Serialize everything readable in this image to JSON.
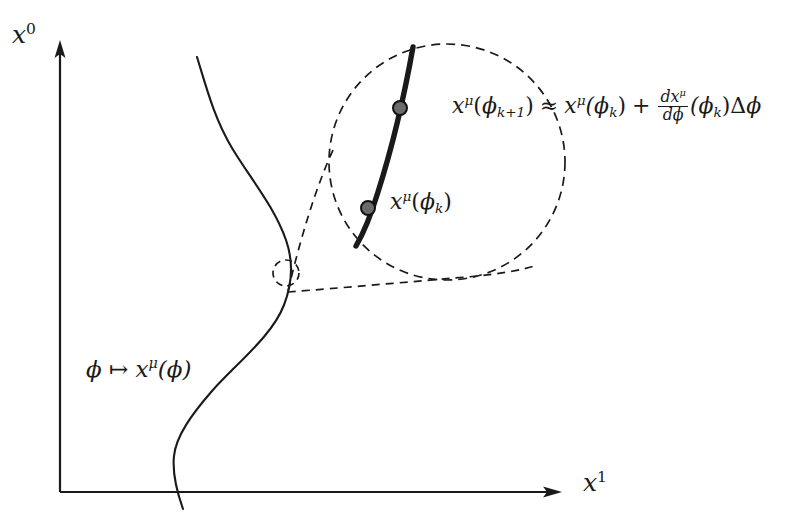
{
  "figure": {
    "type": "mathematical-diagram",
    "background_color": "#ffffff",
    "ink_color": "#1a1a1a",
    "dot_fill_color": "#666666"
  },
  "axes": {
    "y_label": "x",
    "y_label_exponent": "0",
    "x_label": "x",
    "x_label_exponent": "1",
    "origin_px": [
      60,
      492
    ],
    "y_axis_top_px": [
      60,
      48
    ],
    "x_axis_right_px": [
      560,
      492
    ]
  },
  "curve": {
    "label_arg": "ϕ",
    "label_maps_to": "↦",
    "label_fn": "x",
    "label_fn_exponent": "μ",
    "label_fn_arg": "(ϕ)",
    "label_full": "ϕ ↦ x^μ(ϕ)"
  },
  "magnifier": {
    "small_circle_center_px": [
      286,
      273
    ],
    "small_circle_radius_px": 13,
    "big_circle_center_px": [
      447,
      162
    ],
    "big_circle_radius_px": 118,
    "cone_apex_px": [
      288,
      291
    ],
    "line_style": "dashed"
  },
  "inset": {
    "segment_start_px": [
      413,
      47
    ],
    "segment_end_px": [
      356,
      246
    ],
    "points": [
      {
        "name": "phi-k-plus-1",
        "px": [
          400,
          108
        ]
      },
      {
        "name": "phi-k",
        "px": [
          368,
          208
        ]
      }
    ],
    "label_point_k": {
      "fn": "x",
      "exponent": "μ",
      "arg_open": "(",
      "arg_sym": "ϕ",
      "arg_sub": "k",
      "arg_close": ")"
    },
    "label_taylor": {
      "lhs_fn": "x",
      "lhs_exponent": "μ",
      "lhs_arg_open": "(",
      "lhs_arg_sym": "ϕ",
      "lhs_arg_sub": "k+1",
      "lhs_arg_close": ")",
      "relation": "≈",
      "rhs1_fn": "x",
      "rhs1_exponent": "μ",
      "rhs1_arg": "(ϕ",
      "rhs1_sub": "k",
      "rhs1_close": ")",
      "plus": "+",
      "frac_num_d": "d",
      "frac_num_x": "x",
      "frac_num_exp": "μ",
      "frac_den_d": "d",
      "frac_den_phi": "ϕ",
      "rhs2_arg": "(ϕ",
      "rhs2_sub": "k",
      "rhs2_close": ")",
      "delta": "Δ",
      "delta_phi": "ϕ",
      "full_text": "x^μ(ϕ_{k+1}) ≈ x^μ(ϕ_k) + (dx^μ/dϕ)(ϕ_k)Δϕ"
    }
  }
}
